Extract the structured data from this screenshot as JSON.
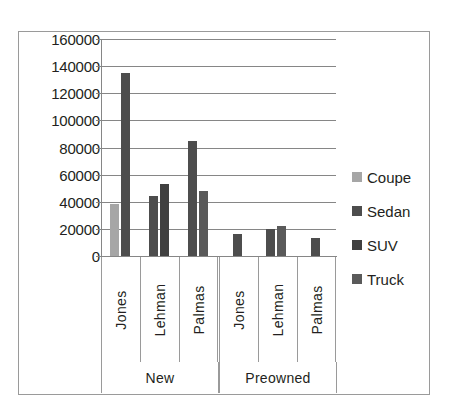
{
  "chart_data": {
    "type": "bar",
    "title": "",
    "subtitle": "",
    "xlabel": "",
    "ylabel": "",
    "grid": true,
    "legend_position": "right",
    "ylim": [
      0,
      160000
    ],
    "ytick_step": 20000,
    "ytick_labels": [
      "160000",
      "140000",
      "120000",
      "100000",
      "80000",
      "60000",
      "40000",
      "20000",
      "0"
    ],
    "ytick_values": [
      160000,
      140000,
      120000,
      100000,
      80000,
      60000,
      40000,
      20000,
      0
    ],
    "groups": [
      "New",
      "Preowned"
    ],
    "categories": [
      "Jones",
      "Lehman",
      "Palmas",
      "Jones",
      "Lehman",
      "Palmas"
    ],
    "category_groups": [
      {
        "label": "New",
        "categories": [
          "Jones",
          "Lehman",
          "Palmas"
        ]
      },
      {
        "label": "Preowned",
        "categories": [
          "Jones",
          "Lehman",
          "Palmas"
        ]
      }
    ],
    "series": [
      {
        "name": "Coupe",
        "color": "#a6a6a6",
        "values": [
          38000,
          0,
          0,
          0,
          0,
          0
        ]
      },
      {
        "name": "Sedan",
        "color": "#4d4d4d",
        "values": [
          135000,
          44000,
          85000,
          16000,
          20000,
          13000
        ]
      },
      {
        "name": "SUV",
        "color": "#404040",
        "values": [
          0,
          53000,
          48000,
          0,
          22000,
          0
        ]
      },
      {
        "name": "Truck",
        "color": "#5a5a5a",
        "values": [
          0,
          0,
          0,
          0,
          0,
          0
        ]
      }
    ],
    "bars": [
      {
        "group": "New",
        "category": "Jones",
        "series": "Coupe",
        "value": 38000,
        "color": "#a6a6a6"
      },
      {
        "group": "New",
        "category": "Jones",
        "series": "Sedan",
        "value": 135000,
        "color": "#4d4d4d"
      },
      {
        "group": "New",
        "category": "Lehman",
        "series": "Sedan",
        "value": 44000,
        "color": "#4d4d4d"
      },
      {
        "group": "New",
        "category": "Lehman",
        "series": "SUV",
        "value": 53000,
        "color": "#404040"
      },
      {
        "group": "New",
        "category": "Palmas",
        "series": "Sedan",
        "value": 85000,
        "color": "#4d4d4d"
      },
      {
        "group": "New",
        "category": "Palmas",
        "series": "SUV",
        "value": 48000,
        "color": "#5a5a5a"
      },
      {
        "group": "Preowned",
        "category": "Jones",
        "series": "Sedan",
        "value": 16000,
        "color": "#4d4d4d"
      },
      {
        "group": "Preowned",
        "category": "Lehman",
        "series": "Sedan",
        "value": 20000,
        "color": "#4d4d4d"
      },
      {
        "group": "Preowned",
        "category": "Lehman",
        "series": "SUV",
        "value": 22000,
        "color": "#5a5a5a"
      },
      {
        "group": "Preowned",
        "category": "Palmas",
        "series": "Sedan",
        "value": 13000,
        "color": "#4d4d4d"
      }
    ],
    "legend": [
      {
        "label": "Coupe",
        "color": "#a6a6a6"
      },
      {
        "label": "Sedan",
        "color": "#4d4d4d"
      },
      {
        "label": "SUV",
        "color": "#404040"
      },
      {
        "label": "Truck",
        "color": "#5a5a5a"
      }
    ],
    "colors": {
      "axis": "#868686",
      "frame": "#9a9a9a",
      "text": "#231f20",
      "background": "#ffffff"
    }
  }
}
